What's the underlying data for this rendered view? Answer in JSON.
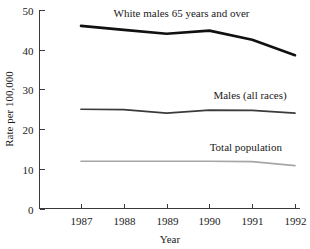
{
  "chart_data": {
    "type": "line",
    "title": "",
    "subtitle": "",
    "xlabel": "Year",
    "ylabel": "Rate per 100,000",
    "categories": [
      "1987",
      "1988",
      "1989",
      "1990",
      "1991",
      "1992"
    ],
    "x": [
      1987,
      1988,
      1989,
      1990,
      1991,
      1992
    ],
    "xlim": [
      1987,
      1992
    ],
    "ylim": [
      0,
      50
    ],
    "yticks": [
      0,
      10,
      20,
      30,
      40,
      50
    ],
    "ytick_labels": [
      "0",
      "10",
      "20",
      "30",
      "40",
      "50"
    ],
    "xticks": [
      1987,
      1988,
      1989,
      1990,
      1991,
      1992
    ],
    "xtick_labels": [
      "1987",
      "1988",
      "1989",
      "1990",
      "1991",
      "1992"
    ],
    "grid": false,
    "legend_position": "inline-annotations",
    "series": [
      {
        "name": "White males 65 years and over",
        "values": [
          46.0,
          45.0,
          44.0,
          44.8,
          42.5,
          38.6
        ],
        "color": "#111111",
        "width": 2.6,
        "label_x": 1989.35,
        "label_y": 48.2,
        "label_anchor": "middle"
      },
      {
        "name": "Males (all races)",
        "values": [
          25.0,
          24.9,
          24.0,
          24.8,
          24.7,
          24.0
        ],
        "color": "#3b3b3b",
        "width": 1.7,
        "label_x": 1990.95,
        "label_y": 27.6,
        "label_anchor": "middle"
      },
      {
        "name": "Total population",
        "values": [
          11.9,
          11.9,
          11.9,
          11.9,
          11.8,
          10.8
        ],
        "color": "#a6a6a6",
        "width": 1.6,
        "label_x": 1990.85,
        "label_y": 14.6,
        "label_anchor": "middle"
      }
    ],
    "annotations": [
      "White males 65 years and over",
      "Males (all races)",
      "Total population"
    ]
  },
  "axes": {
    "y_title": "Rate per 100,000",
    "x_title": "Year"
  }
}
